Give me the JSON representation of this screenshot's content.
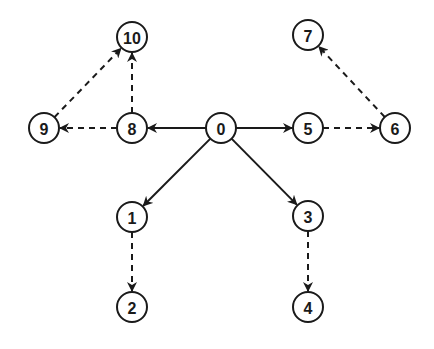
{
  "diagram": {
    "type": "directed-graph",
    "node_radius": 15,
    "colors": {
      "stroke": "#1a1a1a",
      "fill": "#ffffff",
      "background": "#ffffff"
    },
    "nodes": [
      {
        "id": "0",
        "label": "0",
        "x": 221,
        "y": 128
      },
      {
        "id": "1",
        "label": "1",
        "x": 132,
        "y": 217
      },
      {
        "id": "2",
        "label": "2",
        "x": 132,
        "y": 307
      },
      {
        "id": "3",
        "label": "3",
        "x": 308,
        "y": 216
      },
      {
        "id": "4",
        "label": "4",
        "x": 308,
        "y": 307
      },
      {
        "id": "5",
        "label": "5",
        "x": 308,
        "y": 128
      },
      {
        "id": "6",
        "label": "6",
        "x": 395,
        "y": 128
      },
      {
        "id": "7",
        "label": "7",
        "x": 308,
        "y": 35
      },
      {
        "id": "8",
        "label": "8",
        "x": 132,
        "y": 128
      },
      {
        "id": "9",
        "label": "9",
        "x": 44,
        "y": 128
      },
      {
        "id": "10",
        "label": "10",
        "x": 132,
        "y": 37
      }
    ],
    "edges": [
      {
        "from": "0",
        "to": "8",
        "style": "solid"
      },
      {
        "from": "0",
        "to": "5",
        "style": "solid"
      },
      {
        "from": "0",
        "to": "1",
        "style": "solid"
      },
      {
        "from": "0",
        "to": "3",
        "style": "solid"
      },
      {
        "from": "8",
        "to": "9",
        "style": "dashed"
      },
      {
        "from": "8",
        "to": "10",
        "style": "dashed"
      },
      {
        "from": "9",
        "to": "10",
        "style": "dashed"
      },
      {
        "from": "5",
        "to": "6",
        "style": "dashed"
      },
      {
        "from": "6",
        "to": "7",
        "style": "dashed"
      },
      {
        "from": "1",
        "to": "2",
        "style": "dashed"
      },
      {
        "from": "3",
        "to": "4",
        "style": "dashed"
      }
    ]
  }
}
